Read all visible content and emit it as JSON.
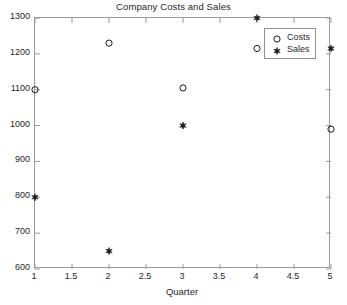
{
  "chart_data": {
    "type": "scatter",
    "title": "Company Costs and Sales",
    "xlabel": "Quarter",
    "ylabel": "",
    "xlim": [
      1,
      5
    ],
    "ylim": [
      600,
      1300
    ],
    "xticks": [
      1,
      1.5,
      2,
      2.5,
      3,
      3.5,
      4,
      4.5,
      5
    ],
    "xtick_labels": [
      "1",
      "1.5",
      "2",
      "2.5",
      "3",
      "3.5",
      "4",
      "4.5",
      "5"
    ],
    "yticks": [
      600,
      700,
      800,
      900,
      1000,
      1100,
      1200,
      1300
    ],
    "ytick_labels": [
      "600",
      "700",
      "800",
      "900",
      "1000",
      "1100",
      "1200",
      "1300"
    ],
    "grid": false,
    "legend_position": "upper right",
    "x": [
      1,
      2,
      3,
      4,
      5
    ],
    "series": [
      {
        "name": "Costs",
        "marker": "circle-open",
        "color": "#1a1a1a",
        "values": [
          1100,
          1230,
          1105,
          1215,
          990
        ]
      },
      {
        "name": "Sales",
        "marker": "star-filled",
        "color": "#1a1a1a",
        "values": [
          800,
          650,
          1000,
          1300,
          1215
        ]
      }
    ]
  },
  "legend": {
    "entries": [
      {
        "label": "Costs"
      },
      {
        "label": "Sales"
      }
    ]
  },
  "style": {
    "axis_color": "#9a9a9a",
    "text_color": "#1f1f1f",
    "background": "#ffffff"
  }
}
